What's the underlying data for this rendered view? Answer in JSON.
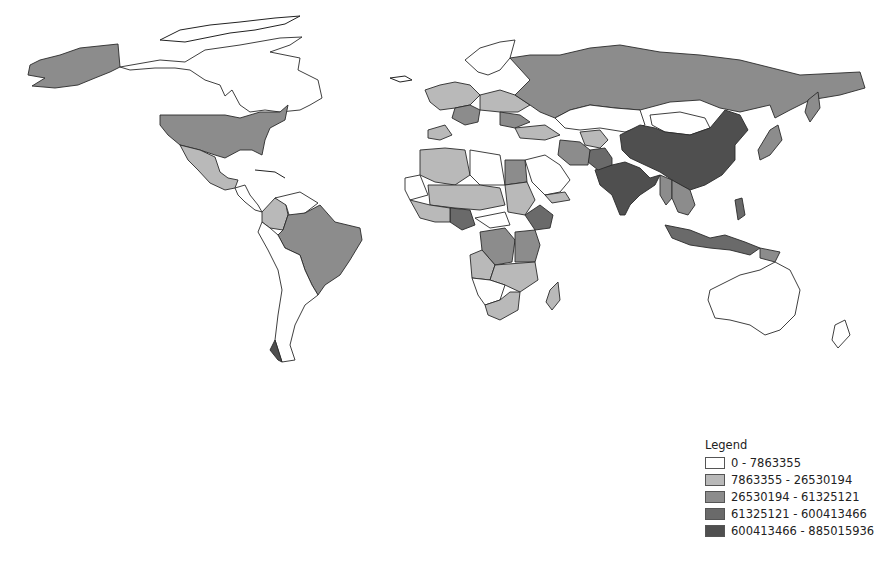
{
  "map": {
    "title": "World population choropleth",
    "classes": [
      {
        "id": "c0",
        "color": "#ffffff",
        "label": "0 - 7863355",
        "min": 0,
        "max": 7863355
      },
      {
        "id": "c1",
        "color": "#b9b9b9",
        "label": "7863355 - 26530194",
        "min": 7863355,
        "max": 26530194
      },
      {
        "id": "c2",
        "color": "#8c8c8c",
        "label": "26530194 - 61325121",
        "min": 26530194,
        "max": 61325121
      },
      {
        "id": "c3",
        "color": "#6a6a6a",
        "label": "61325121 - 600413466",
        "min": 61325121,
        "max": 600413466
      },
      {
        "id": "c4",
        "color": "#4f4f4f",
        "label": "600413466 - 885015936",
        "min": 600413466,
        "max": 885015936
      }
    ]
  },
  "legend": {
    "title": "Legend",
    "items": [
      {
        "label": "0 - 7863355",
        "color": "#ffffff"
      },
      {
        "label": "7863355 - 26530194",
        "color": "#b9b9b9"
      },
      {
        "label": "26530194 - 61325121",
        "color": "#8c8c8c"
      },
      {
        "label": "61325121 - 600413466",
        "color": "#6a6a6a"
      },
      {
        "label": "600413466 - 885015936",
        "color": "#4f4f4f"
      }
    ]
  }
}
